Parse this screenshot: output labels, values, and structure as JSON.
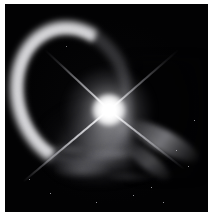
{
  "image": {
    "kind": "astronomical-photograph",
    "subject": "bright-star-with-circumstellar-nebula-arc",
    "frame": {
      "background_color": "#020203",
      "page_color": "#ffffff",
      "width_px": 211,
      "height_px": 221,
      "inset_left_px": 5,
      "inset_top_px": 4,
      "frame_width_px": 203,
      "frame_height_px": 208
    },
    "alt_text": "Black square astronomical image showing a brilliant white central star with four-point diffraction spikes, surrounded by a bright crescent-shaped nebular arc opening toward the lower right, plus a fainter detached arc fragment at lower right and diffuse nebulosity below the star.",
    "features": [
      {
        "name": "central-star",
        "label": "Central star",
        "center_x_pct": 51,
        "center_y_pct": 51,
        "brightness": "saturated-white",
        "color": "#ffffff"
      },
      {
        "name": "diffraction-spikes",
        "label": "Four-point diffraction spikes",
        "count": 4,
        "orientation_deg": [
          38,
          140,
          223,
          319
        ],
        "color": "#f2f2f6"
      },
      {
        "name": "nebula-arc-main",
        "label": "Bright crescent nebular arc",
        "position": "left-and-upper",
        "opening_direction": "lower-right",
        "color": "#d6d6da"
      },
      {
        "name": "nebula-arc-fragment",
        "label": "Detached arc fragment",
        "position": "lower-right",
        "color": "#bcbcc2"
      },
      {
        "name": "diffuse-nebulosity",
        "label": "Diffuse nebulosity",
        "position": "below-star",
        "color": "#a8a8ac"
      }
    ],
    "field_stars": [
      {
        "x_pct": 84,
        "y_pct": 70,
        "size_px": 1.4
      },
      {
        "x_pct": 90,
        "y_pct": 78,
        "size_px": 1.2
      },
      {
        "x_pct": 72,
        "y_pct": 88,
        "size_px": 1.3
      },
      {
        "x_pct": 63,
        "y_pct": 92,
        "size_px": 1.1
      },
      {
        "x_pct": 22,
        "y_pct": 91,
        "size_px": 1.1
      },
      {
        "x_pct": 12,
        "y_pct": 84,
        "size_px": 1.0
      },
      {
        "x_pct": 93,
        "y_pct": 56,
        "size_px": 1.0
      },
      {
        "x_pct": 45,
        "y_pct": 95,
        "size_px": 1.0
      },
      {
        "x_pct": 78,
        "y_pct": 95,
        "size_px": 1.1
      },
      {
        "x_pct": 30,
        "y_pct": 20,
        "size_px": 0.9
      }
    ]
  }
}
